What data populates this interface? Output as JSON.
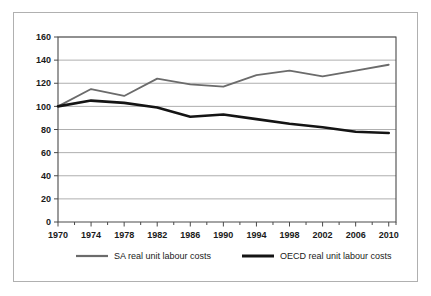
{
  "chart_data": {
    "type": "line",
    "title": "",
    "subtitle": "",
    "xlabel": "",
    "ylabel": "",
    "x": [
      1970,
      1974,
      1978,
      1982,
      1986,
      1990,
      1994,
      1998,
      2002,
      2006,
      2010
    ],
    "xtick_labels": [
      "1970",
      "1974",
      "1978",
      "1982",
      "1986",
      "1990",
      "1994",
      "1998",
      "2002",
      "2006",
      "2010"
    ],
    "ytick_labels": [
      "0",
      "20",
      "40",
      "60",
      "80",
      "100",
      "120",
      "140",
      "160"
    ],
    "yticks": [
      0,
      20,
      40,
      60,
      80,
      100,
      120,
      140,
      160
    ],
    "ylim": [
      0,
      160
    ],
    "xlim": [
      1968,
      2012
    ],
    "grid": "horizontal",
    "legend_position": "bottom",
    "series": [
      {
        "name": "SA real unit labour costs",
        "color": "#6b6b6b",
        "width": 1.8,
        "values": [
          100,
          115,
          109,
          124,
          119,
          117,
          127,
          131,
          126,
          131,
          136
        ]
      },
      {
        "name": "OECD real unit labour costs",
        "color": "#141414",
        "width": 2.6,
        "values": [
          100,
          105,
          103,
          99,
          91,
          93,
          89,
          85,
          82,
          78,
          77
        ]
      }
    ]
  },
  "legend": {
    "items": [
      {
        "label": "SA real unit labour costs"
      },
      {
        "label": "OECD real unit labour costs"
      }
    ]
  }
}
